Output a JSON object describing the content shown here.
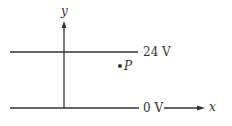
{
  "diagram": {
    "axis_y_label": "y",
    "axis_x_label": "x",
    "top_line_label": "24 V",
    "bottom_line_label": "0 V",
    "point_label": "P",
    "stroke_color": "#333333"
  }
}
